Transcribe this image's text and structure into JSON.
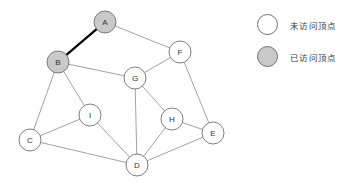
{
  "figure": {
    "background_color": "#ffffff",
    "edge_color": "#8a8a8a",
    "highlight_edge_color": "#000000",
    "node_stroke_color": "#6f6f6f",
    "unvisited_fill": "#ffffff",
    "visited_fill": "#c9c9c9",
    "label_color": "#333333"
  },
  "graph": {
    "nodes": [
      {
        "id": "A",
        "label": "A",
        "x": 105,
        "y": 22,
        "r": 11,
        "state": "visited"
      },
      {
        "id": "B",
        "label": "B",
        "x": 58,
        "y": 62,
        "r": 11,
        "state": "visited"
      },
      {
        "id": "C",
        "label": "C",
        "x": 30,
        "y": 140,
        "r": 11,
        "state": "unvisited"
      },
      {
        "id": "D",
        "label": "D",
        "x": 137,
        "y": 165,
        "r": 11,
        "state": "unvisited"
      },
      {
        "id": "E",
        "label": "E",
        "x": 213,
        "y": 133,
        "r": 11,
        "state": "unvisited"
      },
      {
        "id": "F",
        "label": "F",
        "x": 180,
        "y": 52,
        "r": 11,
        "state": "unvisited"
      },
      {
        "id": "G",
        "label": "G",
        "x": 135,
        "y": 78,
        "r": 11,
        "state": "unvisited"
      },
      {
        "id": "H",
        "label": "H",
        "x": 172,
        "y": 119,
        "r": 11,
        "state": "unvisited"
      },
      {
        "id": "I",
        "label": "I",
        "x": 90,
        "y": 115,
        "r": 11,
        "state": "unvisited"
      }
    ],
    "edges": [
      {
        "from": "A",
        "to": "B",
        "highlighted": true
      },
      {
        "from": "A",
        "to": "F",
        "highlighted": false
      },
      {
        "from": "B",
        "to": "G",
        "highlighted": false
      },
      {
        "from": "B",
        "to": "C",
        "highlighted": false
      },
      {
        "from": "B",
        "to": "I",
        "highlighted": false
      },
      {
        "from": "C",
        "to": "I",
        "highlighted": false
      },
      {
        "from": "C",
        "to": "D",
        "highlighted": false
      },
      {
        "from": "I",
        "to": "D",
        "highlighted": false
      },
      {
        "from": "G",
        "to": "F",
        "highlighted": false
      },
      {
        "from": "G",
        "to": "D",
        "highlighted": false
      },
      {
        "from": "G",
        "to": "H",
        "highlighted": false
      },
      {
        "from": "F",
        "to": "E",
        "highlighted": false
      },
      {
        "from": "H",
        "to": "E",
        "highlighted": false
      },
      {
        "from": "H",
        "to": "D",
        "highlighted": false
      },
      {
        "from": "E",
        "to": "D",
        "highlighted": false
      }
    ]
  },
  "legend": {
    "items": [
      {
        "key": "unvisited",
        "label": "未访问顶点",
        "fill": "#ffffff"
      },
      {
        "key": "visited",
        "label": "已访问顶点",
        "fill": "#c9c9c9"
      }
    ]
  }
}
